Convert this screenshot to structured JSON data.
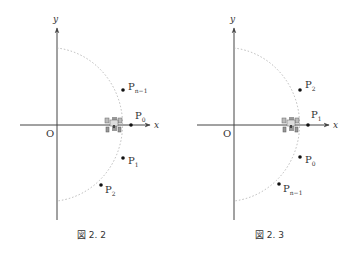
{
  "figures": [
    {
      "id": "fig-2-2",
      "caption": "図 2. 2",
      "axis_x": "x",
      "axis_y": "y",
      "origin": "O",
      "points": [
        {
          "label": "P",
          "sub": "n−1",
          "x": 123,
          "y": 90
        },
        {
          "label": "P",
          "sub": "0",
          "x": 131,
          "y": 125
        },
        {
          "label": "P",
          "sub": "1",
          "x": 123,
          "y": 158
        },
        {
          "label": "P",
          "sub": "2",
          "x": 101,
          "y": 185
        }
      ]
    },
    {
      "id": "fig-2-3",
      "caption": "図 2. 3",
      "axis_x": "x",
      "axis_y": "y",
      "origin": "O",
      "points": [
        {
          "label": "P",
          "sub": "2",
          "x": 300,
          "y": 90
        },
        {
          "label": "P",
          "sub": "1",
          "x": 308,
          "y": 125
        },
        {
          "label": "P",
          "sub": "0",
          "x": 300,
          "y": 157
        },
        {
          "label": "P",
          "sub": "n−1",
          "x": 279,
          "y": 184
        }
      ]
    }
  ]
}
